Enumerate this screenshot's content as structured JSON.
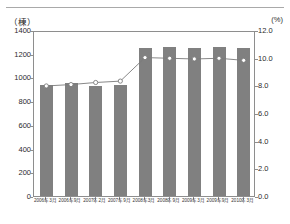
{
  "figure": {
    "left_axis_unit": "（棟）",
    "right_axis_unit": "(%)",
    "top_rule": "divider-rule"
  },
  "chart_data": {
    "type": "bar",
    "title": "",
    "subtitle": "",
    "xlabel": "",
    "ylabel": "（棟）",
    "y2label": "(%)",
    "grid": false,
    "legend": "none",
    "categories": [
      "2006年3月",
      "2006年9月",
      "2007年2月",
      "2007年9月",
      "2008年3月",
      "2008年9月",
      "2009年3月",
      "2009年9月",
      "2010年3月"
    ],
    "series": [
      {
        "name": "棟数",
        "type": "bar",
        "axis": "left",
        "color": "#808080",
        "values": [
          935,
          955,
          930,
          940,
          1250,
          1255,
          1245,
          1260,
          1250
        ]
      },
      {
        "name": "比率",
        "type": "line",
        "axis": "right",
        "color": "#7a7a7a",
        "marker": "open-circle",
        "values": [
          8.1,
          8.2,
          8.35,
          8.45,
          10.15,
          10.1,
          10.05,
          10.1,
          9.95
        ]
      }
    ],
    "ylim": [
      0,
      1400
    ],
    "yticks": [
      0,
      200,
      400,
      600,
      800,
      1000,
      1200,
      1400
    ],
    "ytick_labels": [
      "0",
      "200",
      "400",
      "600",
      "800",
      "1000",
      "1200",
      "1400"
    ],
    "y2lim": [
      0.0,
      12.0
    ],
    "y2ticks": [
      0.0,
      2.0,
      4.0,
      6.0,
      8.0,
      10.0,
      12.0
    ],
    "y2tick_labels": [
      "0.0",
      "2.0",
      "4.0",
      "6.0",
      "8.0",
      "10.0",
      "12.0"
    ]
  }
}
